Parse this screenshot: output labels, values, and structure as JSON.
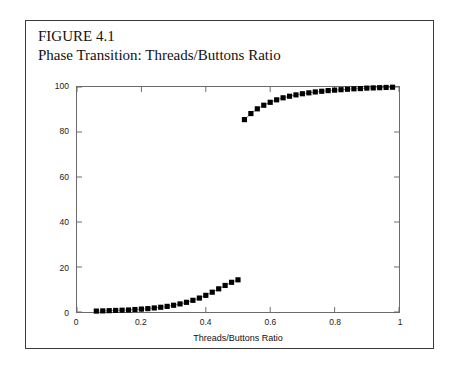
{
  "caption": {
    "figure_number": "FIGURE 4.1",
    "figure_title": "Phase Transition: Threads/Buttons Ratio"
  },
  "chart_data": {
    "type": "scatter",
    "title": "Phase Transition: Threads/Buttons Ratio",
    "xlabel": "Threads/Buttons Ratio",
    "ylabel": "Size of the Largest Cluster(%)",
    "xlim": [
      0,
      1
    ],
    "ylim": [
      0,
      100
    ],
    "xticks": [
      0,
      0.2,
      0.4,
      0.6,
      0.8,
      1
    ],
    "xtick_labels": [
      "0",
      "0.2",
      "0.4",
      "0.6",
      "0.8",
      "1"
    ],
    "yticks": [
      0,
      20,
      40,
      60,
      80,
      100
    ],
    "ytick_labels": [
      "0",
      "20",
      "40",
      "60",
      "80",
      "100"
    ],
    "grid": false,
    "legend": "none",
    "marker": "filled-square",
    "marker_color": "#000000",
    "line_color": "#8c8c8c",
    "series": [
      {
        "name": "sub-critical branch",
        "x": [
          0.06,
          0.08,
          0.1,
          0.12,
          0.14,
          0.16,
          0.18,
          0.2,
          0.22,
          0.24,
          0.26,
          0.28,
          0.3,
          0.32,
          0.34,
          0.36,
          0.38,
          0.4,
          0.42,
          0.44,
          0.46,
          0.48,
          0.5
        ],
        "y": [
          0.4,
          0.5,
          0.6,
          0.7,
          0.8,
          0.9,
          1.1,
          1.3,
          1.5,
          1.8,
          2.1,
          2.5,
          3.0,
          3.6,
          4.3,
          5.2,
          6.2,
          7.4,
          8.8,
          10.3,
          11.8,
          13.2,
          14.3
        ]
      },
      {
        "name": "super-critical branch",
        "x": [
          0.52,
          0.54,
          0.56,
          0.58,
          0.6,
          0.62,
          0.64,
          0.66,
          0.68,
          0.7,
          0.72,
          0.74,
          0.76,
          0.78,
          0.8,
          0.82,
          0.84,
          0.86,
          0.88,
          0.9,
          0.92,
          0.94,
          0.96,
          0.98
        ],
        "y": [
          85.5,
          88.2,
          90.3,
          91.9,
          93.2,
          94.3,
          95.2,
          95.9,
          96.5,
          97.0,
          97.4,
          97.8,
          98.1,
          98.4,
          98.6,
          98.8,
          99.0,
          99.2,
          99.3,
          99.5,
          99.6,
          99.7,
          99.8,
          99.9
        ]
      }
    ]
  }
}
